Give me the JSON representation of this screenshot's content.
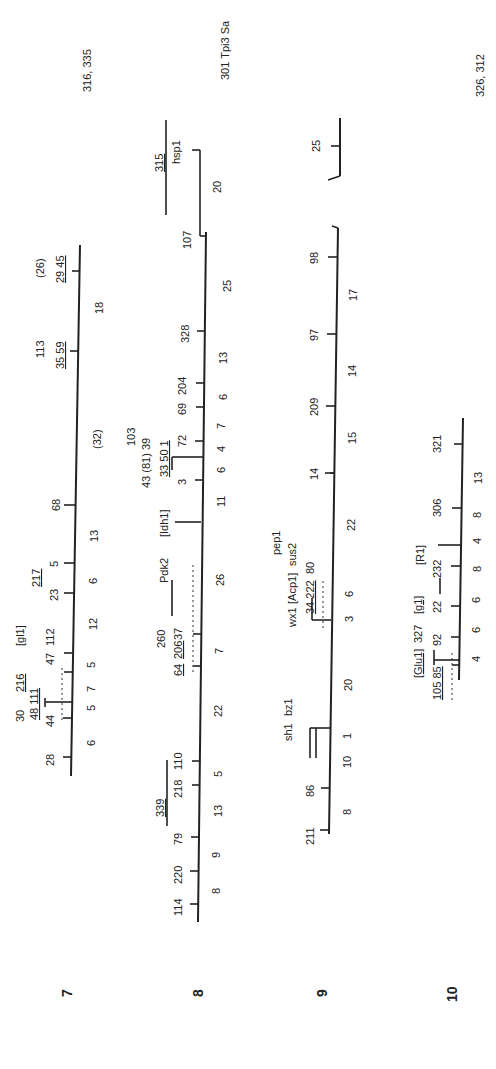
{
  "chromosomes": [
    {
      "id": "7",
      "label": "7",
      "top_note": "316, 335",
      "markers": [
        "28",
        "44",
        "48 111",
        "30",
        "216",
        "47",
        "112",
        "[gl1]",
        "23",
        "217",
        "5",
        "68",
        "113",
        "35 59",
        "29 45",
        "(26)"
      ],
      "intervals": [
        "6",
        "5",
        "7",
        "5",
        "12",
        "6",
        "13",
        "(32)",
        "18"
      ],
      "dashed": "- - 0 - - +"
    },
    {
      "id": "8",
      "label": "8",
      "top_note": "",
      "markers": [
        "114",
        "220",
        "79",
        "339",
        "218",
        "110",
        "64",
        "206",
        "260",
        "37",
        "Pdk2",
        "[Idh1]",
        "3",
        "43 (81) 39",
        "33 50 1",
        "103",
        "72",
        "69",
        "204",
        "328",
        "107",
        "315",
        "hsp1"
      ],
      "intervals": [
        "8",
        "9",
        "13",
        "5",
        "22",
        "7",
        "26",
        "11",
        "6",
        "4",
        "7",
        "6",
        "13",
        "25",
        "20"
      ],
      "dashed": "- + - - + - 0 - - - - - - - -"
    },
    {
      "id": "9",
      "label": "9",
      "top_note": "301 Tpi3 Sa",
      "markers": [
        "211",
        "86",
        "sh1",
        "bz1",
        "wx1",
        "34 222",
        "[Acp1]",
        "80",
        "sus2",
        "pep1",
        "14",
        "209",
        "97",
        "98",
        "25"
      ],
      "intervals": [
        "8",
        "10",
        "1",
        "20",
        "3",
        "6",
        "22",
        "15",
        "14",
        "17"
      ],
      "dashed": "- 1 - 0 - 1 -"
    },
    {
      "id": "10",
      "label": "10",
      "top_note": "326, 312",
      "markers": [
        "105 85",
        "[Glu1]",
        "327",
        "92",
        "[g1]",
        "22",
        "232",
        "[R1]",
        "306",
        "321"
      ],
      "intervals": [
        "4",
        "6",
        "6",
        "8",
        "4",
        "8",
        "13"
      ],
      "dashed": "- - - 0 - 1 -"
    }
  ]
}
